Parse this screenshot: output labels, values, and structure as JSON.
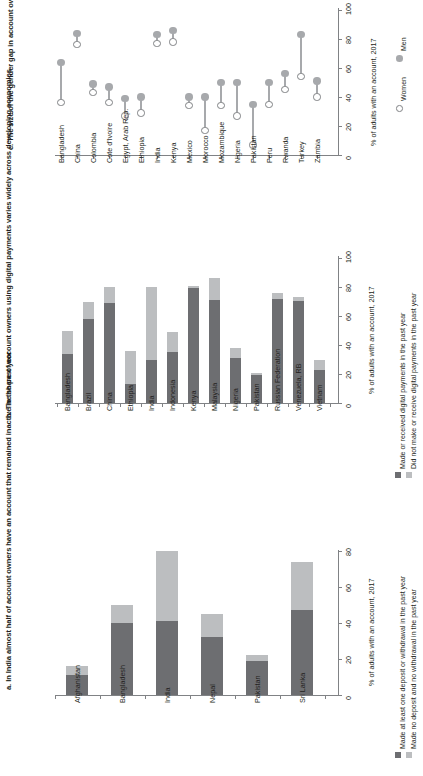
{
  "figure": {
    "orientation": "rotated-90",
    "colors": {
      "dark_gray": "#6d6e71",
      "light_gray": "#bcbec0",
      "marker_gray": "#a7a9ac",
      "axis_gray": "#808285",
      "text": "#231f20"
    }
  },
  "panel_c": {
    "title": "c. The size of the gender gap in account ownership varies across economies",
    "axis_title": "% of adults with an account, 2017",
    "legend": [
      {
        "key": "women",
        "label": "Women",
        "marker": "open-circle"
      },
      {
        "key": "men",
        "label": "Men",
        "marker": "filled-circle"
      }
    ],
    "chart_data": {
      "type": "scatter",
      "subtype": "dumbbell",
      "title": "c. The size of the gender gap in account ownership varies across economies",
      "xlabel": "",
      "ylabel": "% of adults with an account, 2017",
      "ylim": [
        0,
        100
      ],
      "yticks": [
        0,
        20,
        40,
        60,
        80,
        100
      ],
      "grid": false,
      "legend_position": "right",
      "categories": [
        "Bangladesh",
        "China",
        "Colombia",
        "Cote d'Ivoire",
        "Egypt, Arab Rep.",
        "Ethiopia",
        "India",
        "Kenya",
        "Mexico",
        "Morocco",
        "Mozambique",
        "Nigeria",
        "Pakistan",
        "Peru",
        "Rwanda",
        "Turkey",
        "Zambia"
      ],
      "series": [
        {
          "name": "Men",
          "marker": "filled-circle",
          "values": [
            64,
            84,
            49,
            47,
            39,
            40,
            83,
            86,
            40,
            40,
            50,
            50,
            35,
            50,
            56,
            83,
            51
          ]
        },
        {
          "name": "Women",
          "marker": "open-circle",
          "values": [
            36,
            76,
            43,
            36,
            27,
            29,
            77,
            78,
            34,
            17,
            34,
            27,
            7,
            35,
            45,
            54,
            40
          ]
        }
      ]
    }
  },
  "panel_b": {
    "title": "b. The share of account owners using digital payments varies widely across developing economies",
    "axis_title": "% of adults with an account, 2017",
    "legend": [
      {
        "key": "made",
        "label": "Made or received digital payments in the past year",
        "color": "#6d6e71"
      },
      {
        "key": "not_made",
        "label": "Did not make or receive digital payments in the past year",
        "color": "#bcbec0"
      }
    ],
    "chart_data": {
      "type": "bar",
      "subtype": "stacked",
      "title": "b. The share of account owners using digital payments varies widely across developing economies",
      "xlabel": "",
      "ylabel": "% of adults with an account, 2017",
      "ylim": [
        0,
        100
      ],
      "yticks": [
        0,
        20,
        40,
        60,
        80,
        100
      ],
      "grid": false,
      "legend_position": "right",
      "categories": [
        "Bangladesh",
        "Brazil",
        "China",
        "Ethiopia",
        "India",
        "Indonesia",
        "Kenya",
        "Malaysia",
        "Nigeria",
        "Pakistan",
        "Russian Federation",
        "Venezuela, RB",
        "Vietnam"
      ],
      "series": [
        {
          "name": "Made or received digital payments in the past year",
          "color": "#6d6e71",
          "values": [
            34,
            58,
            69,
            13,
            30,
            35,
            79,
            71,
            31,
            19,
            72,
            70,
            23
          ]
        },
        {
          "name": "Did not make or receive digital payments in the past year",
          "color": "#bcbec0",
          "values": [
            16,
            12,
            11,
            23,
            50,
            14,
            2,
            15,
            7,
            2,
            4,
            3,
            7
          ]
        }
      ],
      "totals": [
        50,
        70,
        80,
        36,
        80,
        49,
        81,
        86,
        38,
        21,
        76,
        73,
        30
      ]
    }
  },
  "panel_a": {
    "title": "a. In India almost half of account owners have an account that remained inactive in the past year",
    "axis_title": "% of adults with an account, 2017",
    "legend": [
      {
        "key": "active",
        "label": "Made at least one deposit or withdrawal in the past year",
        "color": "#6d6e71"
      },
      {
        "key": "inactive",
        "label": "Made no deposit and no withdrawal in the past year",
        "color": "#bcbec0"
      }
    ],
    "chart_data": {
      "type": "bar",
      "subtype": "stacked",
      "title": "a. In India almost half of account owners have an account that remained inactive in the past year",
      "xlabel": "",
      "ylabel": "% of adults with an account, 2017",
      "ylim": [
        0,
        80
      ],
      "yticks": [
        0,
        20,
        40,
        60,
        80
      ],
      "grid": false,
      "legend_position": "right",
      "categories": [
        "Afghanistan",
        "Bangladesh",
        "India",
        "Nepal",
        "Pakistan",
        "Sri Lanka"
      ],
      "series": [
        {
          "name": "Made at least one deposit or withdrawal in the past year",
          "color": "#6d6e71",
          "values": [
            11,
            40,
            41,
            32,
            19,
            47
          ]
        },
        {
          "name": "Made no deposit and no withdrawal in the past year",
          "color": "#bcbec0",
          "values": [
            5,
            10,
            39,
            13,
            3,
            27
          ]
        }
      ],
      "totals": [
        16,
        50,
        80,
        45,
        22,
        74
      ]
    }
  }
}
